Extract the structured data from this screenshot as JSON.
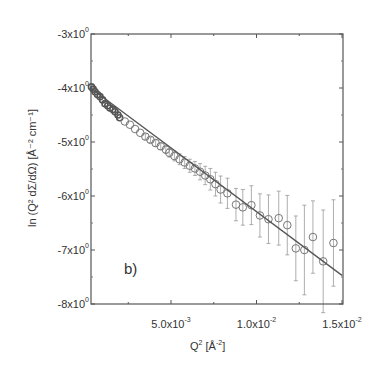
{
  "chart_data": {
    "type": "scatter",
    "panel_label": "b)",
    "title": "",
    "xlabel": "Q² [Å⁻²]",
    "xlabel_parts": {
      "base": "Q",
      "sup": "2",
      "unit_pre": " [Å",
      "unit_sup": "-2",
      "unit_post": "]"
    },
    "ylabel": "ln (Q² dΣ/dΩ) [Å⁻² cm⁻¹]",
    "xlim": [
      0.0003,
      0.015
    ],
    "ylim": [
      -8,
      -3
    ],
    "x_ticks": [
      {
        "value": 0.005,
        "label": "5.0x10",
        "exp": "-3"
      },
      {
        "value": 0.01,
        "label": "1.0x10",
        "exp": "-2"
      },
      {
        "value": 0.015,
        "label": "1.5x10",
        "exp": "-2"
      }
    ],
    "y_ticks": [
      {
        "value": -3,
        "label": "-3x10",
        "exp": "0"
      },
      {
        "value": -4,
        "label": "-4x10",
        "exp": "0"
      },
      {
        "value": -5,
        "label": "-5x10",
        "exp": "0"
      },
      {
        "value": -6,
        "label": "-6x10",
        "exp": "0"
      },
      {
        "value": -7,
        "label": "-7x10",
        "exp": "0"
      },
      {
        "value": -8,
        "label": "-8x10",
        "exp": "0"
      }
    ],
    "grid": false,
    "legend": null,
    "series": [
      {
        "name": "data",
        "marker": "open-circle",
        "color": "#666666",
        "x": [
          0.00035,
          0.00045,
          0.00056,
          0.0007,
          0.00085,
          0.001,
          0.00114,
          0.0013,
          0.00143,
          0.0016,
          0.00173,
          0.0019,
          0.002,
          0.0023,
          0.0026,
          0.0029,
          0.0032,
          0.0035,
          0.0038,
          0.0041,
          0.0044,
          0.0047,
          0.0049,
          0.0052,
          0.0055,
          0.0058,
          0.0061,
          0.0064,
          0.0067,
          0.007,
          0.0073,
          0.0076,
          0.0079,
          0.0083,
          0.0088,
          0.0092,
          0.0097,
          0.0102,
          0.0107,
          0.0113,
          0.0118,
          0.0123,
          0.0128,
          0.0133,
          0.0139,
          0.0145
        ],
        "y": [
          -3.98,
          -4.02,
          -4.07,
          -4.12,
          -4.16,
          -4.22,
          -4.29,
          -4.33,
          -4.37,
          -4.4,
          -4.44,
          -4.5,
          -4.55,
          -4.62,
          -4.68,
          -4.76,
          -4.83,
          -4.9,
          -4.96,
          -5.02,
          -5.08,
          -5.14,
          -5.2,
          -5.26,
          -5.32,
          -5.38,
          -5.44,
          -5.49,
          -5.55,
          -5.62,
          -5.69,
          -5.78,
          -5.88,
          -5.95,
          -6.16,
          -6.21,
          -6.17,
          -6.36,
          -6.43,
          -6.41,
          -6.54,
          -6.97,
          -7.0,
          -6.76,
          -7.21,
          -6.87
        ],
        "yerr": [
          0.02,
          0.02,
          0.02,
          0.02,
          0.02,
          0.02,
          0.02,
          0.02,
          0.02,
          0.02,
          0.02,
          0.03,
          0.03,
          0.03,
          0.03,
          0.04,
          0.04,
          0.05,
          0.05,
          0.06,
          0.06,
          0.07,
          0.08,
          0.09,
          0.1,
          0.11,
          0.12,
          0.13,
          0.15,
          0.17,
          0.2,
          0.22,
          0.25,
          0.28,
          0.3,
          0.33,
          0.36,
          0.4,
          0.45,
          0.5,
          0.55,
          0.6,
          0.83,
          0.67,
          0.95,
          0.8
        ]
      },
      {
        "name": "fit",
        "type": "line",
        "color": "#555555",
        "x": [
          0.0003,
          0.015
        ],
        "y": [
          -4.0,
          -7.47
        ]
      }
    ]
  }
}
